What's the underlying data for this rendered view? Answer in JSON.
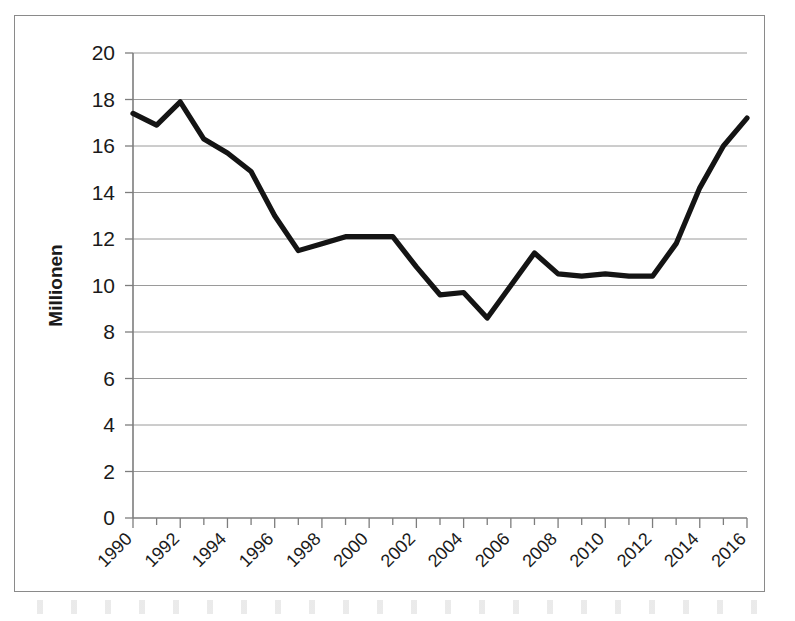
{
  "figure": {
    "caption_fragment": "",
    "border_color": "#8a8a8a",
    "line_color": "#141414",
    "grid_color": "#9a9a9a"
  },
  "chart_data": {
    "type": "line",
    "title": "",
    "xlabel": "",
    "ylabel": "Millionen",
    "ylim": [
      0,
      20
    ],
    "xlim": [
      1990,
      2016
    ],
    "grid": "horizontal",
    "legend": "none",
    "ytick_labels": [
      "0",
      "2",
      "4",
      "6",
      "8",
      "10",
      "12",
      "14",
      "16",
      "18",
      "20"
    ],
    "ytick_values": [
      0,
      2,
      4,
      6,
      8,
      10,
      12,
      14,
      16,
      18,
      20
    ],
    "xtick_labels": [
      "1990",
      "1992",
      "1994",
      "1996",
      "1998",
      "2000",
      "2002",
      "2004",
      "2006",
      "2008",
      "2010",
      "2012",
      "2014",
      "2016"
    ],
    "xtick_values": [
      1990,
      1992,
      1994,
      1996,
      1998,
      2000,
      2002,
      2004,
      2006,
      2008,
      2010,
      2012,
      2014,
      2016
    ],
    "xtick_rotation_deg": 45,
    "x": [
      1990,
      1991,
      1992,
      1993,
      1994,
      1995,
      1996,
      1997,
      1998,
      1999,
      2000,
      2001,
      2002,
      2003,
      2004,
      2005,
      2006,
      2007,
      2008,
      2009,
      2010,
      2011,
      2012,
      2013,
      2014,
      2015,
      2016
    ],
    "series": [
      {
        "name": "Millionen",
        "values": [
          17.4,
          16.9,
          17.9,
          16.3,
          15.7,
          14.9,
          13.0,
          11.5,
          11.8,
          12.1,
          12.1,
          12.1,
          10.8,
          9.6,
          9.7,
          8.6,
          10.0,
          11.4,
          10.5,
          10.4,
          10.5,
          10.4,
          10.4,
          11.8,
          14.2,
          16.0,
          17.2
        ]
      }
    ],
    "annotations": []
  }
}
